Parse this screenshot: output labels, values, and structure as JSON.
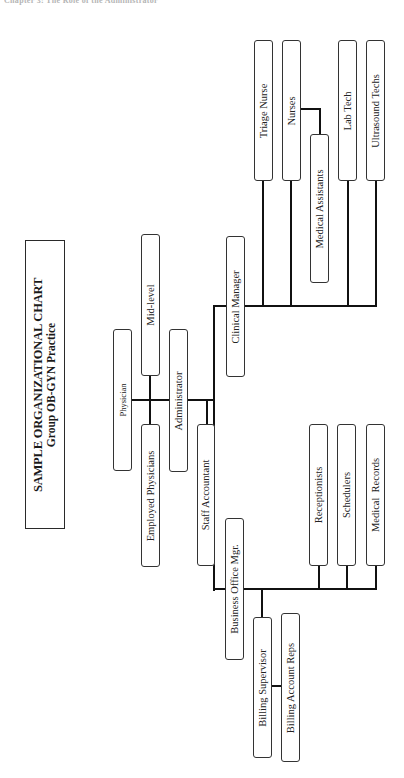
{
  "running_head": "Chapter 3: The Role of the Administrator",
  "title": {
    "line1": "SAMPLE ORGANIZATIONAL CHART",
    "line2": "Group OB-GYN Practice"
  },
  "nodes": {
    "physician": "Physician",
    "mid_level": "Mid-level",
    "employed_physicians": "Employed Physicians",
    "administrator": "Administrator",
    "staff_accountant": "Staff Accountant",
    "clinical_manager": "Clinical Manager",
    "business_office_mgr": "Business Office Mgr.",
    "triage_nurse": "Triage Nurse",
    "nurses": "Nurses",
    "medical_assistants": "Medical Assistants",
    "lab_tech": "Lab Tech",
    "ultrasound_techs": "Ultrasound Techs",
    "receptionists": "Receptionists",
    "schedulers": "Schedulers",
    "medical_records": "Medical  Records",
    "billing_supervisor": "Billing Supervisor",
    "billing_account_reps": "Billing Account Reps"
  },
  "hierarchy": {
    "Physician": [
      "Mid-level",
      "Employed Physicians",
      "Administrator"
    ],
    "Administrator": [
      "Staff Accountant",
      "Clinical Manager",
      "Business Office Mgr."
    ],
    "Clinical Manager": [
      "Triage Nurse",
      "Nurses",
      "Lab Tech",
      "Ultrasound Techs"
    ],
    "Nurses": [
      "Medical Assistants"
    ],
    "Business Office Mgr.": [
      "Receptionists",
      "Schedulers",
      "Medical  Records",
      "Billing Supervisor"
    ],
    "Billing Supervisor": [
      "Billing Account Reps"
    ]
  },
  "colors": {
    "line": "#111111",
    "box_border": "#333333",
    "background": "#ffffff"
  }
}
